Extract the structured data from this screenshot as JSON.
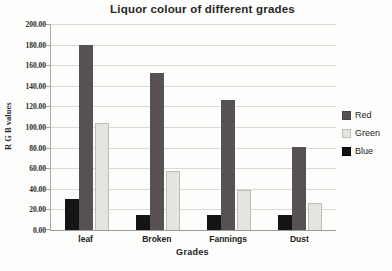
{
  "chart_data": {
    "type": "bar",
    "title": "Liquor colour of different grades",
    "xlabel": "Grades",
    "ylabel": "R G B values",
    "categories": [
      "leaf",
      "Broken",
      "Fannings",
      "Dust"
    ],
    "bar_order_in_group": [
      "Blue",
      "Red",
      "Green"
    ],
    "series": [
      {
        "name": "Red",
        "color": "#575154",
        "border": "#474244",
        "values": [
          180,
          152,
          126,
          81
        ]
      },
      {
        "name": "Green",
        "color": "#e4e5e1",
        "border": "#bcbdb8",
        "values": [
          104,
          57,
          39,
          26
        ]
      },
      {
        "name": "Blue",
        "color": "#141414",
        "border": "#000000",
        "values": [
          30,
          15,
          15,
          15
        ]
      }
    ],
    "ylim": [
      0,
      200
    ],
    "ytick_step": 20,
    "ytick_labels": [
      "0.00",
      "20.00",
      "40.00",
      "60.00",
      "80.00",
      "100.00",
      "120.00",
      "140.00",
      "160.00",
      "180.00",
      "200.00"
    ],
    "grid": true,
    "legend": {
      "position": "right",
      "entries": [
        "Red",
        "Green",
        "Blue"
      ]
    }
  },
  "colors": {
    "background": "#fdfdfb",
    "gridline": "#d9d9d5",
    "axis": "#a6a6a2",
    "text": "#1c1c1c"
  }
}
